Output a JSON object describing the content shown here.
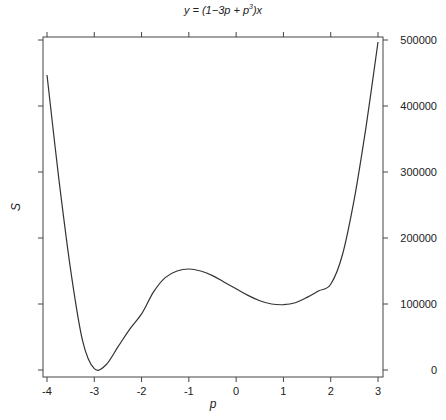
{
  "chart_data": {
    "type": "line",
    "title_parts": {
      "pre": "y = (1−3p + p",
      "sup": "3",
      "post": ")x"
    },
    "xlabel": "p",
    "ylabel": "S",
    "xlim": [
      -4,
      3
    ],
    "ylim": [
      0,
      500000
    ],
    "x_ticks": [
      -4,
      -3,
      -2,
      -1,
      0,
      1,
      2,
      3
    ],
    "x_tick_labels": [
      "-4",
      "-3",
      "-2",
      "-1",
      "0",
      "1",
      "2",
      "3"
    ],
    "y_ticks": [
      0,
      100000,
      200000,
      300000,
      400000,
      500000
    ],
    "y_tick_labels": [
      "0",
      "100000",
      "200000",
      "300000",
      "400000",
      "500000"
    ],
    "y_axis_label_side": "right",
    "grid": false,
    "legend": null,
    "series": [
      {
        "name": "S",
        "x": [
          -4.0,
          -3.75,
          -3.5,
          -3.25,
          -3.0,
          -2.75,
          -2.5,
          -2.25,
          -2.0,
          -1.75,
          -1.5,
          -1.25,
          -1.0,
          -0.75,
          -0.5,
          -0.25,
          0.0,
          0.25,
          0.5,
          0.75,
          1.0,
          1.25,
          1.5,
          1.75,
          2.0,
          2.25,
          2.5,
          2.75,
          3.0
        ],
        "values": [
          447000,
          290000,
          152000,
          45000,
          2000,
          8000,
          35000,
          62000,
          85000,
          118000,
          140000,
          150000,
          153000,
          150000,
          143000,
          133000,
          123000,
          113000,
          105000,
          100000,
          99000,
          102000,
          110000,
          120000,
          130000,
          175000,
          260000,
          370000,
          497000
        ]
      }
    ]
  }
}
